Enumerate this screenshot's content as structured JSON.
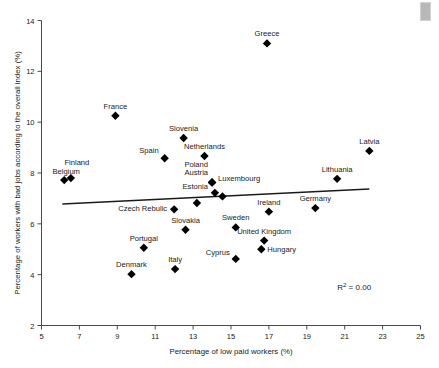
{
  "chart_data": {
    "type": "scatter",
    "title": "",
    "xlabel": "Percentage of low paid workers (%)",
    "ylabel": "Percentage of workers with bad jobs according to the overall index (%)",
    "xlim": [
      5,
      25
    ],
    "ylim": [
      2,
      14
    ],
    "xticks": [
      5,
      7,
      9,
      11,
      13,
      15,
      17,
      19,
      21,
      23,
      25
    ],
    "yticks": [
      2,
      4,
      6,
      8,
      10,
      12,
      14
    ],
    "grid": false,
    "legend": null,
    "annotations": [
      {
        "name": "r-squared",
        "text": "R2 = 0.00",
        "x": 21.5,
        "y": 3.4
      }
    ],
    "trendline": {
      "x": [
        6.1,
        22.3
      ],
      "y": [
        6.78,
        7.37
      ]
    },
    "points": [
      {
        "label": "Greece",
        "x": 16.9,
        "y": 13.1,
        "label_dx": 0,
        "label_dy": -7,
        "anchor": "middle"
      },
      {
        "label": "France",
        "x": 8.9,
        "y": 10.25,
        "label_dx": 0,
        "label_dy": -7,
        "anchor": "middle"
      },
      {
        "label": "Slovenia",
        "x": 12.5,
        "y": 9.38,
        "label_dx": 0,
        "label_dy": -7,
        "anchor": "middle"
      },
      {
        "label": "Latvia",
        "x": 22.3,
        "y": 8.87,
        "label_dx": 0,
        "label_dy": -7,
        "anchor": "middle"
      },
      {
        "label": "Netherlands",
        "x": 13.6,
        "y": 8.67,
        "label_dx": 0,
        "label_dy": -7,
        "anchor": "middle"
      },
      {
        "label": "Spain",
        "x": 11.5,
        "y": 8.58,
        "label_dx": -6,
        "label_dy": -5,
        "anchor": "end"
      },
      {
        "label": "Belgium",
        "x": 6.2,
        "y": 7.72,
        "label_dx": 2,
        "label_dy": -6,
        "anchor": "middle"
      },
      {
        "label": "Finland",
        "x": 6.55,
        "y": 7.8,
        "label_dx": 6,
        "label_dy": -13,
        "anchor": "middle"
      },
      {
        "label": "Lithuania",
        "x": 20.6,
        "y": 7.77,
        "label_dx": 0,
        "label_dy": -7,
        "anchor": "middle"
      },
      {
        "label": "Austria",
        "x": 14.0,
        "y": 7.63,
        "label_dx": -4,
        "label_dy": -7,
        "anchor": "end"
      },
      {
        "label": "Poland",
        "x": 14.0,
        "y": 7.63,
        "label_dx": -4,
        "label_dy": -15,
        "anchor": "end"
      },
      {
        "label": "Luxembourg",
        "x": 14.0,
        "y": 7.63,
        "label_dx": 6,
        "label_dy": -1,
        "anchor": "start"
      },
      {
        "label": "Estonia",
        "x": 14.15,
        "y": 7.22,
        "label_dx": -7,
        "label_dy": -4,
        "anchor": "end"
      },
      {
        "label": "",
        "x": 14.55,
        "y": 7.08,
        "label_dx": 0,
        "label_dy": 0,
        "anchor": "middle"
      },
      {
        "label": "",
        "x": 13.2,
        "y": 6.82,
        "label_dx": 0,
        "label_dy": 0,
        "anchor": "middle"
      },
      {
        "label": "Germany",
        "x": 19.45,
        "y": 6.62,
        "label_dx": 0,
        "label_dy": -7,
        "anchor": "middle"
      },
      {
        "label": "Czech Rebulic",
        "x": 12.0,
        "y": 6.57,
        "label_dx": -7,
        "label_dy": 2,
        "anchor": "end"
      },
      {
        "label": "Ireland",
        "x": 17.0,
        "y": 6.48,
        "label_dx": 0,
        "label_dy": -7,
        "anchor": "middle"
      },
      {
        "label": "Sweden",
        "x": 15.25,
        "y": 5.86,
        "label_dx": 0,
        "label_dy": -7,
        "anchor": "middle"
      },
      {
        "label": "Slovakia",
        "x": 12.6,
        "y": 5.77,
        "label_dx": 0,
        "label_dy": -7,
        "anchor": "middle"
      },
      {
        "label": "United Kingdom",
        "x": 16.75,
        "y": 5.34,
        "label_dx": 0,
        "label_dy": -7,
        "anchor": "middle"
      },
      {
        "label": "Portugal",
        "x": 10.4,
        "y": 5.06,
        "label_dx": 0,
        "label_dy": -7,
        "anchor": "middle"
      },
      {
        "label": "Hungary",
        "x": 16.6,
        "y": 5.0,
        "label_dx": 6,
        "label_dy": 3,
        "anchor": "start"
      },
      {
        "label": "Cyprus",
        "x": 15.25,
        "y": 4.62,
        "label_dx": -6,
        "label_dy": -4,
        "anchor": "end"
      },
      {
        "label": "Italy",
        "x": 12.05,
        "y": 4.22,
        "label_dx": 0,
        "label_dy": -7,
        "anchor": "middle"
      },
      {
        "label": "Denmark",
        "x": 9.75,
        "y": 4.02,
        "label_dx": 0,
        "label_dy": -7,
        "anchor": "middle"
      }
    ]
  },
  "colors": {
    "marker": "#000000",
    "axis": "#4a4a4a",
    "trend": "#1a1a1a",
    "text": "#1a1a1a",
    "background": "#ffffff",
    "corner_mark": "#b8b8b8"
  }
}
